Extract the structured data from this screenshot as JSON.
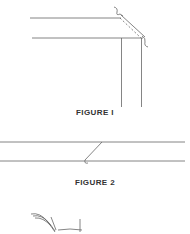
{
  "figures": [
    {
      "caption": "FIGURE I"
    },
    {
      "caption": "FIGURE 2"
    }
  ],
  "colors": {
    "line": "#555555",
    "caption": "#333333",
    "background": "#ffffff"
  }
}
